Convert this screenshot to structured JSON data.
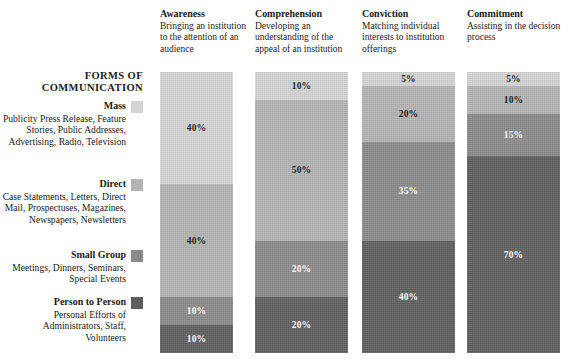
{
  "legend": {
    "heading_line1": "FORMS OF",
    "heading_line2": "COMMUNICATION",
    "items": [
      {
        "name": "Mass",
        "description": "Publicity Press Release, Feature Stories, Public Addresses, Advertising, Radio, Television",
        "color": "#d4d4d4"
      },
      {
        "name": "Direct",
        "description": "Case Statements, Letters, Direct Mail, Prospectuses, Magazines, Newspapers, Newsletters",
        "color": "#b3b3b3"
      },
      {
        "name": "Small Group",
        "description": "Meetings, Dinners, Seminars, Special Events",
        "color": "#8a8a8a"
      },
      {
        "name": "Person to Person",
        "description": "Personal Efforts of Administrators, Staff, Volunteers",
        "color": "#5e5e5e"
      }
    ]
  },
  "columns": [
    {
      "title": "Awareness",
      "subtitle": "Bringing an institution to the attention of an audience"
    },
    {
      "title": "Comprehension",
      "subtitle": "Developing an understanding of the appeal of an institution"
    },
    {
      "title": "Conviction",
      "subtitle": "Matching individual interests to institution offerings"
    },
    {
      "title": "Commitment",
      "subtitle": "Assisting in the decision process"
    }
  ],
  "chart_data": {
    "type": "bar",
    "title": "FORMS OF COMMUNICATION",
    "xlabel": "",
    "ylabel": "",
    "ylim": [
      0,
      100
    ],
    "stacked": true,
    "normalized_percent": true,
    "grid": false,
    "legend_position": "left",
    "categories": [
      "Awareness",
      "Comprehension",
      "Conviction",
      "Commitment"
    ],
    "series": [
      {
        "name": "Mass",
        "color": "#d4d4d4",
        "values": [
          40,
          10,
          5,
          5
        ],
        "labels": [
          "40%",
          "10%",
          "5%",
          "5%"
        ],
        "label_text_colors": [
          "dark",
          "dark",
          "dark",
          "dark"
        ]
      },
      {
        "name": "Direct",
        "color": "#b3b3b3",
        "values": [
          40,
          50,
          20,
          10
        ],
        "labels": [
          "40%",
          "50%",
          "20%",
          "10%"
        ],
        "label_text_colors": [
          "dark",
          "dark",
          "dark",
          "dark"
        ]
      },
      {
        "name": "Small Group",
        "color": "#8a8a8a",
        "values": [
          10,
          20,
          35,
          15
        ],
        "labels": [
          "10%",
          "20%",
          "35%",
          "15%"
        ],
        "label_text_colors": [
          "light",
          "light",
          "light",
          "light"
        ]
      },
      {
        "name": "Person to Person",
        "color": "#5e5e5e",
        "values": [
          10,
          20,
          40,
          70
        ],
        "labels": [
          "10%",
          "20%",
          "40%",
          "70%"
        ],
        "label_text_colors": [
          "light",
          "light",
          "light",
          "light"
        ]
      }
    ]
  }
}
